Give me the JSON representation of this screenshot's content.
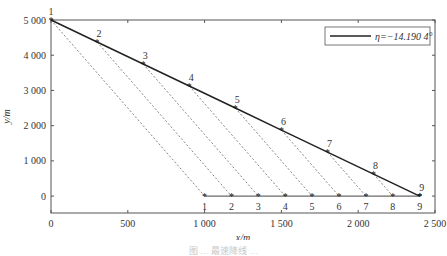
{
  "chart_data": {
    "type": "line",
    "title": "",
    "xlabel": "x/m",
    "ylabel": "y/m",
    "xlim": [
      0,
      2500
    ],
    "ylim": [
      -480,
      5000
    ],
    "grid": false,
    "legend_position": "top-right",
    "x_ticks": [
      0,
      500,
      1000,
      1500,
      2000,
      2500
    ],
    "x_tick_labels": [
      "0",
      "500",
      "1 000",
      "1 500",
      "2 000",
      "2 500"
    ],
    "y_ticks": [
      0,
      1000,
      2000,
      3000,
      4000,
      5000
    ],
    "y_tick_labels": [
      "0",
      "1 000",
      "2 000",
      "3 000",
      "4 000",
      "5 000"
    ],
    "legend": [
      "η=−14.190 4°"
    ],
    "series": [
      {
        "name": "η=−14.190 4°",
        "style": "solid",
        "x": [
          0,
          300,
          600,
          900,
          1200,
          1500,
          1800,
          2100,
          2400
        ],
        "y": [
          5000,
          4375,
          3750,
          3125,
          2500,
          1875,
          1250,
          625,
          0
        ],
        "point_labels": [
          "1",
          "2",
          "3",
          "4",
          "5",
          "6",
          "7",
          "8",
          "9"
        ],
        "marker": "*"
      },
      {
        "name": "ground projection",
        "style": "solid",
        "x": [
          1000,
          1175,
          1350,
          1525,
          1700,
          1875,
          2050,
          2225,
          2400
        ],
        "y": [
          0,
          0,
          0,
          0,
          0,
          0,
          0,
          0,
          0
        ],
        "point_labels": [
          "1",
          "2",
          "3",
          "4",
          "5",
          "6",
          "7",
          "8",
          "9"
        ],
        "marker": "*"
      }
    ],
    "dashed_connectors": [
      {
        "from": [
          0,
          5000
        ],
        "to": [
          1000,
          0
        ]
      },
      {
        "from": [
          300,
          4375
        ],
        "to": [
          1175,
          0
        ]
      },
      {
        "from": [
          600,
          3750
        ],
        "to": [
          1350,
          0
        ]
      },
      {
        "from": [
          900,
          3125
        ],
        "to": [
          1525,
          0
        ]
      },
      {
        "from": [
          1200,
          2500
        ],
        "to": [
          1700,
          0
        ]
      },
      {
        "from": [
          1500,
          1875
        ],
        "to": [
          1875,
          0
        ]
      },
      {
        "from": [
          1800,
          1250
        ],
        "to": [
          2050,
          0
        ]
      },
      {
        "from": [
          2100,
          625
        ],
        "to": [
          2225,
          0
        ]
      }
    ]
  },
  "legend": {
    "label": "η=−14.190 4°"
  },
  "axes": {
    "xlabel": "x/m",
    "ylabel": "y/m"
  },
  "caption": "图 …  最速降线 …"
}
